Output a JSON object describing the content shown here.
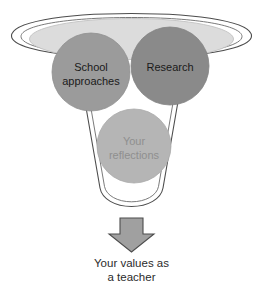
{
  "diagram": {
    "type": "funnel",
    "colors": {
      "funnel_outline": "#4d4d4d",
      "funnel_fill": "#ffffff",
      "funnel_opening_fill": "#dcdcdc",
      "funnel_opening_outline": "#b8b8b8",
      "school_circle": "#9b9b9b",
      "research_circle": "#8a8a8a",
      "reflections_circle": "#b5b5b5",
      "circle_outline": "#8f8f8f",
      "arrow_fill": "#a0a0a0",
      "arrow_outline": "#4d4d4d",
      "dark_text": "#1a1a1a",
      "muted_text": "#8f8f8f",
      "caption_text": "#2b2b2b"
    },
    "inputs": [
      {
        "id": "school-approaches",
        "lines": [
          "School",
          "approaches"
        ],
        "text_tone": "dark"
      },
      {
        "id": "research",
        "lines": [
          "Research"
        ],
        "text_tone": "dark"
      },
      {
        "id": "your-reflections",
        "lines": [
          "Your",
          "reflections"
        ],
        "text_tone": "muted"
      }
    ],
    "arrow": {
      "direction": "down"
    },
    "outcome": {
      "lines": [
        "Your values as",
        "a teacher"
      ]
    }
  }
}
